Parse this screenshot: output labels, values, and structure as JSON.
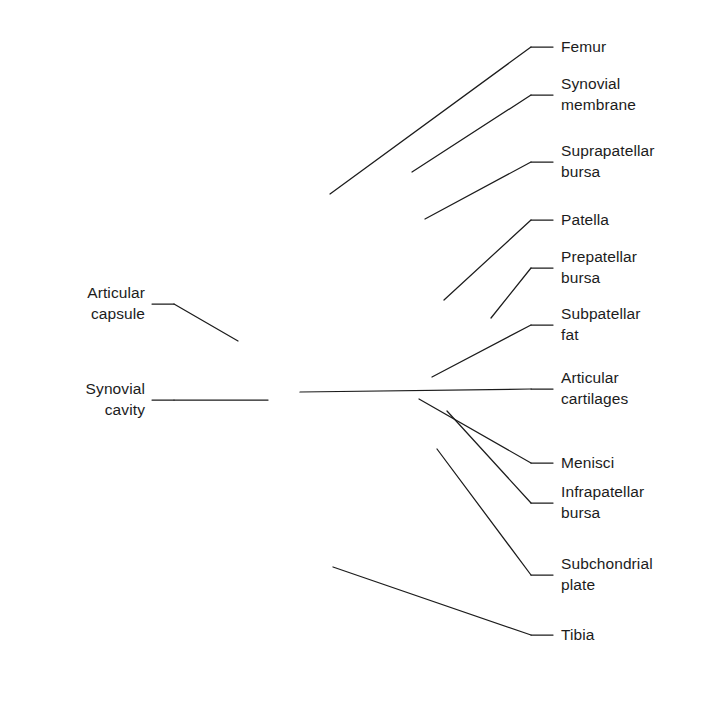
{
  "figure": {
    "background_color": "#ffffff",
    "palette": {
      "soft_tissue": "#ececec",
      "soft_tissue_edge": "#d8d8d8",
      "bone_matrix": "#c9c9c9",
      "trabecula": "#6f6f6f",
      "cortical": "#5a5a5a",
      "cartilage": "#a8a8a8",
      "subchondral_plate": "#575757",
      "capsule": "#6b6b6b",
      "synovial_white": "#fdfdfd",
      "fat_pad": "#e2e2e2",
      "leader_line": "#1c1c1c",
      "text": "#1c1c1c"
    }
  },
  "labels": {
    "right": [
      {
        "id": "femur",
        "text": "Femur",
        "lines": [
          "Femur"
        ],
        "x": 561,
        "y": 36,
        "leader_end_x": 553,
        "leader_end_y": 47,
        "target_x": 330,
        "target_y": 194
      },
      {
        "id": "synovial-membrane",
        "text": "Synovial membrane",
        "lines": [
          "Synovial",
          "membrane"
        ],
        "x": 561,
        "y": 73,
        "leader_end_x": 553,
        "leader_end_y": 95,
        "target_x": 412,
        "target_y": 172
      },
      {
        "id": "suprapatellar-bursa",
        "text": "Suprapatellar bursa",
        "lines": [
          "Suprapatellar",
          "bursa"
        ],
        "x": 561,
        "y": 140,
        "leader_end_x": 553,
        "leader_end_y": 162,
        "target_x": 425,
        "target_y": 219
      },
      {
        "id": "patella",
        "text": "Patella",
        "lines": [
          "Patella"
        ],
        "x": 561,
        "y": 209,
        "leader_end_x": 553,
        "leader_end_y": 220,
        "target_x": 444,
        "target_y": 300
      },
      {
        "id": "prepatellar-bursa",
        "text": "Prepatellar bursa",
        "lines": [
          "Prepatellar",
          "bursa"
        ],
        "x": 561,
        "y": 246,
        "leader_end_x": 553,
        "leader_end_y": 268,
        "target_x": 491,
        "target_y": 318
      },
      {
        "id": "subpatellar-fat",
        "text": "Subpatellar fat",
        "lines": [
          "Subpatellar",
          "fat"
        ],
        "x": 561,
        "y": 303,
        "leader_end_x": 553,
        "leader_end_y": 325,
        "target_x": 432,
        "target_y": 377
      },
      {
        "id": "articular-cartilages",
        "text": "Articular cartilages",
        "lines": [
          "Articular",
          "cartilages"
        ],
        "x": 561,
        "y": 367,
        "leader_end_x": 553,
        "leader_end_y": 389,
        "target_x": 300,
        "target_y": 392
      },
      {
        "id": "menisci",
        "text": "Menisci",
        "lines": [
          "Menisci"
        ],
        "x": 561,
        "y": 452,
        "leader_end_x": 553,
        "leader_end_y": 463,
        "target_x": 419,
        "target_y": 399
      },
      {
        "id": "infrapatellar-bursa",
        "text": "Infrapatellar bursa",
        "lines": [
          "Infrapatellar",
          "bursa"
        ],
        "x": 561,
        "y": 481,
        "leader_end_x": 553,
        "leader_end_y": 503,
        "target_x": 447,
        "target_y": 411
      },
      {
        "id": "subchondrial-plate",
        "text": "Subchondrial plate",
        "lines": [
          "Subchondrial",
          "plate"
        ],
        "x": 561,
        "y": 553,
        "leader_end_x": 553,
        "leader_end_y": 575,
        "target_x": 437,
        "target_y": 449
      },
      {
        "id": "tibia",
        "text": "Tibia",
        "lines": [
          "Tibia"
        ],
        "x": 561,
        "y": 624,
        "leader_end_x": 553,
        "leader_end_y": 635,
        "target_x": 333,
        "target_y": 567
      }
    ],
    "left": [
      {
        "id": "articular-capsule",
        "text": "Articular capsule",
        "lines": [
          "Articular",
          "capsule"
        ],
        "x": 145,
        "y": 282,
        "leader_end_x": 152,
        "leader_end_y": 304,
        "target_x": 238,
        "target_y": 341
      },
      {
        "id": "synovial-cavity",
        "text": "Synovial cavity",
        "lines": [
          "Synovial",
          "cavity"
        ],
        "x": 145,
        "y": 378,
        "leader_end_x": 152,
        "leader_end_y": 400,
        "target_x": 268,
        "target_y": 400
      }
    ]
  }
}
